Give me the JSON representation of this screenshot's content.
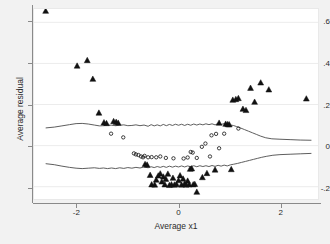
{
  "figure": {
    "background_color": "#f2f2f2",
    "plot_background_color": "#ffffff",
    "marker_color": "#111111",
    "line_color": "#4a4a4a",
    "grid_color": "#ececec"
  },
  "chart_data": {
    "type": "scatter",
    "title": "",
    "xlabel": "Average x1",
    "ylabel": "Average residual",
    "xlim": [
      -2.85,
      2.75
    ],
    "ylim": [
      -0.26,
      0.665
    ],
    "xticks": [
      -2,
      0,
      2
    ],
    "xticklabels": [
      "-2",
      "0",
      "2"
    ],
    "yticks": [
      -0.2,
      0,
      0.2,
      0.4,
      0.6
    ],
    "yticklabels": [
      "-.2",
      "0",
      ".2",
      ".4",
      ".6"
    ],
    "grid": true,
    "grid_axis": "y",
    "legend": null,
    "series": [
      {
        "name": "filled-triangles",
        "marker": "triangle",
        "filled": true,
        "points": [
          [
            -2.62,
            0.655
          ],
          [
            -2.0,
            0.388
          ],
          [
            -1.8,
            0.415
          ],
          [
            -1.69,
            0.324
          ],
          [
            -1.57,
            0.159
          ],
          [
            -1.47,
            0.112
          ],
          [
            -1.42,
            0.108
          ],
          [
            -1.28,
            0.118
          ],
          [
            -1.23,
            0.114
          ],
          [
            -1.19,
            0.11
          ],
          [
            -0.66,
            -0.091
          ],
          [
            -0.62,
            -0.094
          ],
          [
            -0.56,
            -0.144
          ],
          [
            -0.53,
            -0.19
          ],
          [
            -0.47,
            -0.191
          ],
          [
            -0.44,
            -0.167
          ],
          [
            -0.4,
            -0.147
          ],
          [
            -0.36,
            -0.137
          ],
          [
            -0.33,
            -0.176
          ],
          [
            -0.3,
            -0.152
          ],
          [
            -0.27,
            -0.19
          ],
          [
            -0.25,
            -0.163
          ],
          [
            -0.21,
            -0.138
          ],
          [
            -0.18,
            -0.193
          ],
          [
            -0.14,
            -0.19
          ],
          [
            -0.11,
            -0.158
          ],
          [
            -0.08,
            -0.191
          ],
          [
            -0.04,
            -0.189
          ],
          [
            0.0,
            -0.17
          ],
          [
            0.03,
            -0.146
          ],
          [
            0.06,
            -0.191
          ],
          [
            0.09,
            -0.162
          ],
          [
            0.12,
            -0.186
          ],
          [
            0.15,
            -0.191
          ],
          [
            0.18,
            -0.172
          ],
          [
            0.21,
            -0.19
          ],
          [
            0.23,
            -0.114
          ],
          [
            0.26,
            -0.112
          ],
          [
            0.29,
            -0.19
          ],
          [
            0.32,
            -0.188
          ],
          [
            0.36,
            -0.226
          ],
          [
            0.47,
            -0.155
          ],
          [
            0.56,
            -0.135
          ],
          [
            0.72,
            -0.118
          ],
          [
            0.8,
            0.11
          ],
          [
            0.93,
            0.105
          ],
          [
            0.97,
            0.103
          ],
          [
            1.0,
            0.102
          ],
          [
            1.04,
            -0.116
          ],
          [
            1.07,
            0.222
          ],
          [
            1.13,
            0.225
          ],
          [
            1.18,
            0.23
          ],
          [
            1.27,
            0.178
          ],
          [
            1.33,
            0.172
          ],
          [
            1.42,
            0.28
          ],
          [
            1.5,
            0.212
          ],
          [
            1.62,
            0.306
          ],
          [
            1.78,
            0.272
          ],
          [
            2.52,
            0.228
          ]
        ]
      },
      {
        "name": "open-circles",
        "marker": "circle",
        "filled": false,
        "points": [
          [
            -1.33,
            0.058
          ],
          [
            -1.09,
            0.04
          ],
          [
            -0.88,
            -0.038
          ],
          [
            -0.84,
            -0.043
          ],
          [
            -0.79,
            -0.046
          ],
          [
            -0.74,
            -0.053
          ],
          [
            -0.7,
            -0.057
          ],
          [
            -0.67,
            -0.05
          ],
          [
            -0.6,
            -0.057
          ],
          [
            -0.53,
            -0.056
          ],
          [
            -0.44,
            -0.057
          ],
          [
            -0.36,
            -0.053
          ],
          [
            -0.25,
            -0.06
          ],
          [
            -0.1,
            -0.062
          ],
          [
            0.1,
            -0.063
          ],
          [
            0.18,
            -0.058
          ],
          [
            0.24,
            -0.031
          ],
          [
            0.28,
            -0.034
          ],
          [
            0.36,
            -0.06
          ],
          [
            0.46,
            -0.006
          ],
          [
            0.53,
            0.01
          ],
          [
            0.62,
            -0.053
          ],
          [
            0.65,
            0.05
          ],
          [
            0.74,
            0.057
          ],
          [
            0.8,
            -0.013
          ],
          [
            0.9,
            0.058
          ],
          [
            1.18,
            0.083
          ]
        ]
      }
    ],
    "bands": [
      {
        "name": "upper-confidence-band",
        "style": "solid",
        "points": [
          [
            -2.62,
            0.086
          ],
          [
            -2.45,
            0.09
          ],
          [
            -2.3,
            0.096
          ],
          [
            -2.15,
            0.102
          ],
          [
            -2.02,
            0.107
          ],
          [
            -1.9,
            0.108
          ],
          [
            -1.78,
            0.105
          ],
          [
            -1.66,
            0.1
          ],
          [
            -1.56,
            0.096
          ],
          [
            -1.48,
            0.097
          ],
          [
            -1.4,
            0.1
          ],
          [
            -1.32,
            0.099
          ],
          [
            -1.24,
            0.097
          ],
          [
            -1.16,
            0.099
          ],
          [
            -1.08,
            0.101
          ],
          [
            -1.0,
            0.097
          ],
          [
            -0.92,
            0.098
          ],
          [
            -0.84,
            0.101
          ],
          [
            -0.76,
            0.097
          ],
          [
            -0.68,
            0.1
          ],
          [
            -0.6,
            0.094
          ],
          [
            -0.54,
            0.102
          ],
          [
            -0.48,
            0.096
          ],
          [
            -0.42,
            0.101
          ],
          [
            -0.36,
            0.096
          ],
          [
            -0.3,
            0.103
          ],
          [
            -0.24,
            0.097
          ],
          [
            -0.18,
            0.103
          ],
          [
            -0.12,
            0.098
          ],
          [
            -0.06,
            0.104
          ],
          [
            0.0,
            0.099
          ],
          [
            0.06,
            0.104
          ],
          [
            0.12,
            0.098
          ],
          [
            0.18,
            0.104
          ],
          [
            0.24,
            0.099
          ],
          [
            0.3,
            0.105
          ],
          [
            0.36,
            0.1
          ],
          [
            0.42,
            0.105
          ],
          [
            0.48,
            0.101
          ],
          [
            0.54,
            0.106
          ],
          [
            0.6,
            0.102
          ],
          [
            0.66,
            0.106
          ],
          [
            0.72,
            0.101
          ],
          [
            0.78,
            0.107
          ],
          [
            0.84,
            0.103
          ],
          [
            0.9,
            0.107
          ],
          [
            0.96,
            0.104
          ],
          [
            1.02,
            0.1
          ],
          [
            1.08,
            0.098
          ],
          [
            1.14,
            0.093
          ],
          [
            1.22,
            0.086
          ],
          [
            1.3,
            0.078
          ],
          [
            1.38,
            0.07
          ],
          [
            1.46,
            0.062
          ],
          [
            1.54,
            0.054
          ],
          [
            1.62,
            0.046
          ],
          [
            1.72,
            0.038
          ],
          [
            1.84,
            0.033
          ],
          [
            2.0,
            0.031
          ],
          [
            2.2,
            0.029
          ],
          [
            2.4,
            0.027
          ],
          [
            2.62,
            0.026
          ]
        ]
      },
      {
        "name": "lower-confidence-band",
        "style": "solid",
        "points": [
          [
            -2.62,
            -0.088
          ],
          [
            -2.45,
            -0.093
          ],
          [
            -2.3,
            -0.1
          ],
          [
            -2.15,
            -0.106
          ],
          [
            -2.02,
            -0.11
          ],
          [
            -1.9,
            -0.112
          ],
          [
            -1.78,
            -0.11
          ],
          [
            -1.66,
            -0.108
          ],
          [
            -1.56,
            -0.111
          ],
          [
            -1.48,
            -0.109
          ],
          [
            -1.4,
            -0.112
          ],
          [
            -1.32,
            -0.109
          ],
          [
            -1.24,
            -0.112
          ],
          [
            -1.16,
            -0.108
          ],
          [
            -1.08,
            -0.111
          ],
          [
            -1.0,
            -0.107
          ],
          [
            -0.92,
            -0.11
          ],
          [
            -0.84,
            -0.106
          ],
          [
            -0.76,
            -0.109
          ],
          [
            -0.68,
            -0.104
          ],
          [
            -0.6,
            -0.108
          ],
          [
            -0.54,
            -0.103
          ],
          [
            -0.48,
            -0.107
          ],
          [
            -0.42,
            -0.102
          ],
          [
            -0.36,
            -0.106
          ],
          [
            -0.3,
            -0.101
          ],
          [
            -0.24,
            -0.106
          ],
          [
            -0.18,
            -0.1
          ],
          [
            -0.12,
            -0.105
          ],
          [
            -0.06,
            -0.1
          ],
          [
            0.0,
            -0.104
          ],
          [
            0.06,
            -0.099
          ],
          [
            0.12,
            -0.104
          ],
          [
            0.18,
            -0.099
          ],
          [
            0.24,
            -0.103
          ],
          [
            0.3,
            -0.098
          ],
          [
            0.36,
            -0.103
          ],
          [
            0.42,
            -0.098
          ],
          [
            0.48,
            -0.102
          ],
          [
            0.54,
            -0.098
          ],
          [
            0.6,
            -0.102
          ],
          [
            0.66,
            -0.097
          ],
          [
            0.72,
            -0.101
          ],
          [
            0.78,
            -0.096
          ],
          [
            0.84,
            -0.1
          ],
          [
            0.9,
            -0.095
          ],
          [
            0.96,
            -0.099
          ],
          [
            1.02,
            -0.094
          ],
          [
            1.08,
            -0.091
          ],
          [
            1.16,
            -0.087
          ],
          [
            1.24,
            -0.082
          ],
          [
            1.32,
            -0.077
          ],
          [
            1.4,
            -0.072
          ],
          [
            1.48,
            -0.067
          ],
          [
            1.56,
            -0.062
          ],
          [
            1.64,
            -0.057
          ],
          [
            1.74,
            -0.052
          ],
          [
            1.86,
            -0.047
          ],
          [
            2.0,
            -0.044
          ],
          [
            2.2,
            -0.042
          ],
          [
            2.4,
            -0.04
          ],
          [
            2.62,
            -0.038
          ]
        ]
      }
    ]
  }
}
